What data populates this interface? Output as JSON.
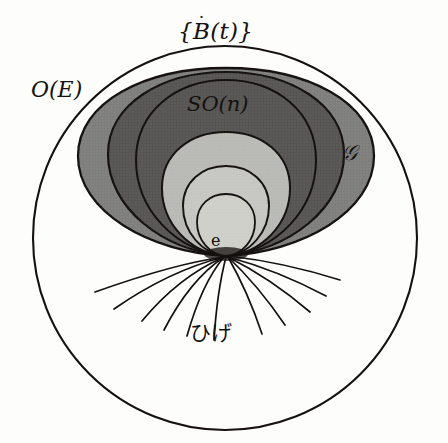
{
  "figure": {
    "background_color": "#fdfdfb",
    "stroke_color": "#14110f",
    "labels": {
      "b_dot_set": "{Ḃ(t)}",
      "b_dot_base": "B",
      "b_dot_accent": "˙",
      "b_dot_open": "{",
      "b_dot_arg": "(t)}",
      "orthogonal_group": "O(E)",
      "special_orthogonal_group": "SO(n)",
      "script_g": "𝒢",
      "identity": "e",
      "whiskers": "ひげ"
    },
    "colors": {
      "outer_white": "#fdfdfb",
      "g_region": "#7e7e7c",
      "son_region": "#565553",
      "inner_light": "#b9b9b5",
      "inner_lighter": "#c6c6c2",
      "innermost": "#cfcfca",
      "line": "#14110f"
    },
    "geometry": {
      "outer_circle": {
        "cx": 225,
        "cy": 238,
        "r": 192
      },
      "apex": {
        "x": 226,
        "y": 256
      },
      "balloon_top_y": 68,
      "whisker_count": 11
    },
    "regions": [
      {
        "name": "O(E)",
        "fill": "#fdfdfb",
        "label": "O(E)"
      },
      {
        "name": "G",
        "fill": "#7e7e7c",
        "label": "𝒢"
      },
      {
        "name": "SO(n)",
        "fill": "#565553",
        "label": "SO(n)"
      },
      {
        "name": "inner-1",
        "fill": "#b9b9b5",
        "label": ""
      },
      {
        "name": "inner-2",
        "fill": "#c6c6c2",
        "label": ""
      },
      {
        "name": "inner-3",
        "fill": "#cfcfca",
        "label": ""
      }
    ]
  }
}
